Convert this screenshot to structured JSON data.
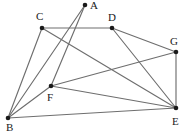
{
  "figure": {
    "type": "undirected-graph-diagram",
    "width": 186,
    "height": 135,
    "background_color": "#ffffff",
    "edge_color": "#6e6e6e",
    "vertex_color": "#1a1a1a",
    "label_color": "#1a1a1a"
  },
  "vertices": [
    {
      "id": "A",
      "label": "A",
      "x": 85,
      "y": 5,
      "label_x": 90,
      "label_y": 0
    },
    {
      "id": "B",
      "label": "B",
      "x": 8,
      "y": 118,
      "label_x": 6,
      "label_y": 122
    },
    {
      "id": "C",
      "label": "C",
      "x": 42,
      "y": 28,
      "label_x": 36,
      "label_y": 11
    },
    {
      "id": "D",
      "label": "D",
      "x": 112,
      "y": 28,
      "label_x": 108,
      "label_y": 12
    },
    {
      "id": "E",
      "label": "E",
      "x": 176,
      "y": 108,
      "label_x": 172,
      "label_y": 116
    },
    {
      "id": "F",
      "label": "F",
      "x": 51,
      "y": 86,
      "label_x": 47,
      "label_y": 92
    },
    {
      "id": "G",
      "label": "G",
      "x": 176,
      "y": 52,
      "label_x": 170,
      "label_y": 36
    }
  ],
  "edges": [
    {
      "from": "A",
      "to": "B"
    },
    {
      "from": "A",
      "to": "F"
    },
    {
      "from": "C",
      "to": "D"
    },
    {
      "from": "C",
      "to": "E"
    },
    {
      "from": "C",
      "to": "B"
    },
    {
      "from": "D",
      "to": "G"
    },
    {
      "from": "D",
      "to": "E"
    },
    {
      "from": "G",
      "to": "E"
    },
    {
      "from": "G",
      "to": "F"
    },
    {
      "from": "F",
      "to": "B"
    },
    {
      "from": "F",
      "to": "E"
    },
    {
      "from": "B",
      "to": "E"
    }
  ]
}
